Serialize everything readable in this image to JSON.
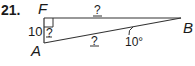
{
  "problem": {
    "number": "21.",
    "vertices": {
      "F": "F",
      "A": "A",
      "B": "B"
    },
    "side_FA_length": "10",
    "unknown_FA_inner": "?",
    "unknown_FB": "?",
    "unknown_AB": "?",
    "angle_B": "10°"
  },
  "colors": {
    "stroke": "#333333",
    "text": "#1a1a1a"
  }
}
